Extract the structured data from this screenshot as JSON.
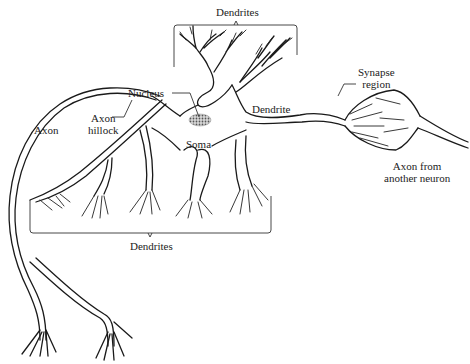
{
  "diagram": {
    "labels": {
      "dendrites_top": "Dendrites",
      "nucleus": "Nucleus",
      "axon": "Axon",
      "axon_hillock_line1": "Axon",
      "axon_hillock_line2": "hillock",
      "soma": "Soma",
      "dendrite": "Dendrite",
      "synapse_line1": "Synapse",
      "synapse_line2": "region",
      "axon_from_line1": "Axon from",
      "axon_from_line2": "another neuron",
      "dendrites_bottom": "Dendrites"
    },
    "colors": {
      "line": "#1a1a1a",
      "nucleus_fill": "#9a9a9a",
      "background": "#ffffff"
    }
  }
}
